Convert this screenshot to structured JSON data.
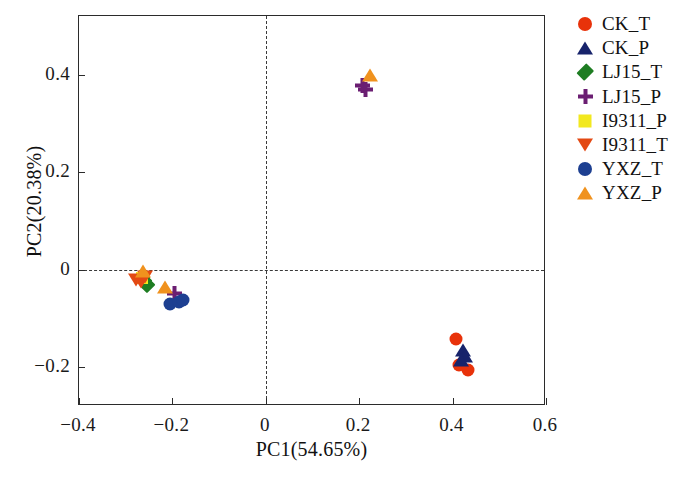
{
  "chart_data": {
    "type": "scatter",
    "title": "",
    "xlabel": "PC1(54.65%)",
    "ylabel": "PC2(20.38%)",
    "xlim": [
      -0.4,
      0.6
    ],
    "ylim": [
      -0.28,
      0.52
    ],
    "xticks": [
      -0.4,
      -0.2,
      0,
      0.2,
      0.4,
      0.6
    ],
    "xticklabels": [
      "−0.4",
      "−0.2",
      "0",
      "0.2",
      "0.4",
      "0.6"
    ],
    "yticks": [
      -0.2,
      0,
      0.2,
      0.4
    ],
    "yticklabels": [
      "−0.2",
      "0",
      "0.2",
      "0.4"
    ],
    "grid": false,
    "reference_lines": {
      "vertical_x": 0,
      "horizontal_y": 0,
      "style": "dashed"
    },
    "legend_position": "right-outside",
    "series": [
      {
        "name": "CK_T",
        "marker": "circle",
        "color": "#e8320a",
        "size": 13,
        "points": [
          {
            "x": 0.408,
            "y": -0.142
          },
          {
            "x": 0.414,
            "y": -0.196
          },
          {
            "x": 0.432,
            "y": -0.206
          }
        ]
      },
      {
        "name": "CK_P",
        "marker": "triangle-up",
        "color": "#17236b",
        "size": 14,
        "points": [
          {
            "x": 0.423,
            "y": -0.166
          },
          {
            "x": 0.427,
            "y": -0.178
          },
          {
            "x": 0.419,
            "y": -0.186
          }
        ]
      },
      {
        "name": "LJ15_T",
        "marker": "diamond",
        "color": "#1e7d22",
        "size": 12,
        "points": [
          {
            "x": -0.252,
            "y": -0.034
          },
          {
            "x": -0.258,
            "y": -0.026
          },
          {
            "x": -0.262,
            "y": -0.02
          }
        ]
      },
      {
        "name": "LJ15_P",
        "marker": "plus",
        "color": "#6b1e72",
        "size": 15,
        "points": [
          {
            "x": -0.196,
            "y": -0.05
          },
          {
            "x": 0.207,
            "y": 0.377
          },
          {
            "x": 0.213,
            "y": 0.37
          }
        ]
      },
      {
        "name": "I9311_P",
        "marker": "square",
        "color": "#f2e81f",
        "size": 12,
        "points": [
          {
            "x": -0.266,
            "y": -0.018
          }
        ]
      },
      {
        "name": "I9311_T",
        "marker": "triangle-down",
        "color": "#e34913",
        "size": 14,
        "points": [
          {
            "x": -0.278,
            "y": -0.022
          },
          {
            "x": -0.268,
            "y": -0.026
          },
          {
            "x": -0.258,
            "y": -0.016
          }
        ]
      },
      {
        "name": "YXZ_T",
        "marker": "circle",
        "color": "#1d3f91",
        "size": 13,
        "points": [
          {
            "x": -0.206,
            "y": -0.07
          },
          {
            "x": -0.186,
            "y": -0.066
          },
          {
            "x": -0.178,
            "y": -0.062
          }
        ]
      },
      {
        "name": "YXZ_P",
        "marker": "triangle-up",
        "color": "#f0921e",
        "size": 14,
        "points": [
          {
            "x": -0.262,
            "y": -0.004
          },
          {
            "x": -0.216,
            "y": -0.036
          },
          {
            "x": 0.224,
            "y": 0.4
          }
        ]
      }
    ]
  },
  "axes": {
    "xlabel": "PC1(54.65%)",
    "ylabel": "PC2(20.38%)",
    "xticklabels": [
      "−0.4",
      "−0.2",
      "0",
      "0.2",
      "0.4",
      "0.6"
    ],
    "yticklabels": [
      "−0.2",
      "0",
      "0.2",
      "0.4"
    ]
  },
  "legend": {
    "items": [
      {
        "label": "CK_T",
        "marker": "circle",
        "color": "#e8320a"
      },
      {
        "label": "CK_P",
        "marker": "triangle-up",
        "color": "#17236b"
      },
      {
        "label": "LJ15_T",
        "marker": "diamond",
        "color": "#1e7d22"
      },
      {
        "label": "LJ15_P",
        "marker": "plus",
        "color": "#6b1e72"
      },
      {
        "label": "I9311_P",
        "marker": "square",
        "color": "#f2e81f"
      },
      {
        "label": "I9311_T",
        "marker": "triangle-down",
        "color": "#e34913"
      },
      {
        "label": "YXZ_T",
        "marker": "circle",
        "color": "#1d3f91"
      },
      {
        "label": "YXZ_P",
        "marker": "triangle-up",
        "color": "#f0921e"
      }
    ]
  }
}
